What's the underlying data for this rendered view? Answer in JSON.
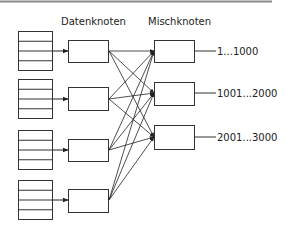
{
  "diagram": {
    "headers": {
      "data_nodes": "Datenknoten",
      "mix_nodes": "Mischknoten"
    },
    "data_sources": [
      {
        "id": "source-1",
        "rows": 4
      },
      {
        "id": "source-2",
        "rows": 4
      },
      {
        "id": "source-3",
        "rows": 4
      },
      {
        "id": "source-4",
        "rows": 4
      }
    ],
    "data_nodes": [
      {
        "id": "data-node-1"
      },
      {
        "id": "data-node-2"
      },
      {
        "id": "data-node-3"
      },
      {
        "id": "data-node-4"
      }
    ],
    "mix_nodes": [
      {
        "id": "mix-node-1",
        "range": "1...1000"
      },
      {
        "id": "mix-node-2",
        "range": "1001...2000"
      },
      {
        "id": "mix-node-3",
        "range": "2001...3000"
      }
    ],
    "connections": "every data node connects to every mix node",
    "colors": {
      "stroke": "#333333",
      "top_rule": "#8a8a8a",
      "background": "#ffffff"
    }
  }
}
